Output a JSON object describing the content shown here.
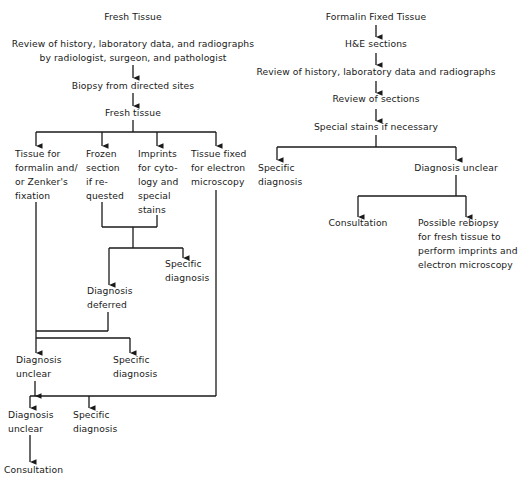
{
  "left_flow": {
    "title": "Fresh Tissue",
    "review": "Review of history, laboratory data, and radiographs\nby radiologist, surgeon, and pathologist",
    "biopsy": "Biopsy from directed sites",
    "fresh_tissue": "Fresh tissue",
    "branches": {
      "formalin": "Tissue for\nformalin and/\nor Zenker's\nfixation",
      "frozen": "Frozen\nsection\nif re-\nquested",
      "imprints": "Imprints\nfor cyto-\nlogy and\nspecial\nstains",
      "electron": "Tissue fixed\nfor electron\nmicroscopy"
    },
    "specific_diagnosis_1": "Specific\ndiagnosis",
    "diagnosis_deferred": "Diagnosis\ndeferred",
    "diagnosis_unclear_1": "Diagnosis\nunclear",
    "specific_diagnosis_2": "Specific\ndiagnosis",
    "diagnosis_unclear_2": "Diagnosis\nunclear",
    "specific_diagnosis_3": "Specific\ndiagnosis",
    "consultation": "Consultation"
  },
  "right_flow": {
    "title": "Formalin Fixed Tissue",
    "he_sections": "H&E sections",
    "review": "Review of history, laboratory data and radiographs",
    "review_sections": "Review of sections",
    "special_stains": "Special stains if necessary",
    "specific_diagnosis": "Specific\ndiagnosis",
    "diagnosis_unclear": "Diagnosis unclear",
    "consultation": "Consultation",
    "rebiopsy": "Possible rebiopsy\nfor fresh tissue to\nperform imprints and\nelectron microscopy"
  },
  "colors": {
    "line": "#1a1a1a",
    "text": "#1a1a1a",
    "background": "#ffffff"
  }
}
